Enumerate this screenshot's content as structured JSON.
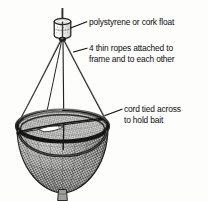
{
  "diagram": {
    "background_color": "#fdfdfc",
    "ink_color": "#1a1a1a",
    "text_color": "#0d0d0d",
    "style": "pen-and-ink line drawing with stippled mesh shading"
  },
  "labels": {
    "float": {
      "text": "polystyrene or cork float",
      "points_to": "float-cylinder"
    },
    "ropes": {
      "line1": "4 thin ropes attached to",
      "line2": "frame and to each other",
      "points_to": "rope-bundle"
    },
    "cord": {
      "line1": "cord tied across",
      "line2": "to hold bait",
      "points_to": "bait-cord"
    }
  },
  "parts": [
    {
      "name": "float-cylinder",
      "label": "polystyrene or cork float"
    },
    {
      "name": "float-stick",
      "label": "vertical stick through float"
    },
    {
      "name": "rope-bundle",
      "label": "4 thin ropes"
    },
    {
      "name": "net-rim",
      "label": "net rim frame ring"
    },
    {
      "name": "net-mesh",
      "label": "mesh net bag"
    },
    {
      "name": "bait-cord",
      "label": "cord tied across opening"
    },
    {
      "name": "bait",
      "label": "bait tied to cord"
    }
  ]
}
